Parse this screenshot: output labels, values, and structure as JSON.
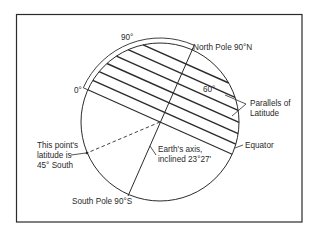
{
  "figure": {
    "type": "latitude-diagram",
    "colors": {
      "ink": "#2b2b2b",
      "background": "#ffffff"
    },
    "axis_tilt": "23°27'",
    "parallel_count": 7,
    "labels": {
      "arc_start": "0°",
      "arc_end": "90°",
      "north_pole": "North Pole 90°N",
      "south_pole": "South Pole 90°S",
      "sixty": "60°",
      "parallels_line1": "Parallels of",
      "parallels_line2": "Latitude",
      "equator": "Equator",
      "axis_line1": "Earth's axis,",
      "axis_line2": "inclined 23°27'",
      "point_line1": "This point's",
      "point_line2": "latitude is",
      "point_line3": "45° South"
    }
  }
}
